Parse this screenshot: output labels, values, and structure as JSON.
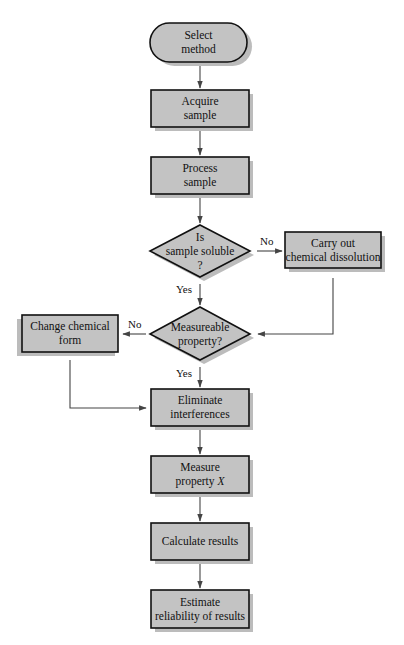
{
  "diagram": {
    "type": "flowchart",
    "nodes": [
      {
        "id": "select",
        "shape": "terminal",
        "lines": [
          "Select",
          "method"
        ]
      },
      {
        "id": "acquire",
        "shape": "process",
        "lines": [
          "Acquire",
          "sample"
        ]
      },
      {
        "id": "process",
        "shape": "process",
        "lines": [
          "Process",
          "sample"
        ]
      },
      {
        "id": "soluble",
        "shape": "decision",
        "lines": [
          "Is",
          "sample soluble",
          "?"
        ]
      },
      {
        "id": "dissolve",
        "shape": "process",
        "lines": [
          "Carry out",
          "chemical dissolution"
        ]
      },
      {
        "id": "measurable",
        "shape": "decision",
        "lines": [
          "Measureable",
          "property?"
        ]
      },
      {
        "id": "change",
        "shape": "process",
        "lines": [
          "Change chemical",
          "form"
        ]
      },
      {
        "id": "eliminate",
        "shape": "process",
        "lines": [
          "Eliminate",
          "interferences"
        ]
      },
      {
        "id": "measure",
        "shape": "process",
        "lines": [
          "Measure",
          "property X"
        ]
      },
      {
        "id": "calculate",
        "shape": "process",
        "lines": [
          "Calculate results"
        ]
      },
      {
        "id": "estimate",
        "shape": "process",
        "lines": [
          "Estimate",
          "reliability of results"
        ]
      }
    ],
    "edges": [
      {
        "from": "select",
        "to": "acquire",
        "label": ""
      },
      {
        "from": "acquire",
        "to": "process",
        "label": ""
      },
      {
        "from": "process",
        "to": "soluble",
        "label": ""
      },
      {
        "from": "soluble",
        "to": "dissolve",
        "label": "No"
      },
      {
        "from": "soluble",
        "to": "measurable",
        "label": "Yes"
      },
      {
        "from": "dissolve",
        "to": "measurable",
        "label": ""
      },
      {
        "from": "measurable",
        "to": "change",
        "label": "No"
      },
      {
        "from": "measurable",
        "to": "eliminate",
        "label": "Yes"
      },
      {
        "from": "change",
        "to": "eliminate",
        "label": ""
      },
      {
        "from": "eliminate",
        "to": "measure",
        "label": ""
      },
      {
        "from": "measure",
        "to": "calculate",
        "label": ""
      },
      {
        "from": "calculate",
        "to": "estimate",
        "label": ""
      }
    ],
    "labels": {
      "no": "No",
      "yes": "Yes"
    },
    "text": {
      "select_1": "Select",
      "select_2": "method",
      "acquire_1": "Acquire",
      "acquire_2": "sample",
      "process_1": "Process",
      "process_2": "sample",
      "soluble_1": "Is",
      "soluble_2": "sample soluble",
      "soluble_3": "?",
      "dissolve_1": "Carry out",
      "dissolve_2": "chemical dissolution",
      "measurable_1": "Measureable",
      "measurable_2": "property?",
      "change_1": "Change chemical",
      "change_2": "form",
      "eliminate_1": "Eliminate",
      "eliminate_2": "interferences",
      "measure_1": "Measure",
      "measure_2a": "property ",
      "measure_2b": "X",
      "calculate_1": "Calculate results",
      "estimate_1": "Estimate",
      "estimate_2": "reliability of results"
    },
    "colors": {
      "fill": "#c3c3c3",
      "shadow": "#bcbcbc",
      "stroke": "#111111",
      "edge": "#444444"
    }
  }
}
